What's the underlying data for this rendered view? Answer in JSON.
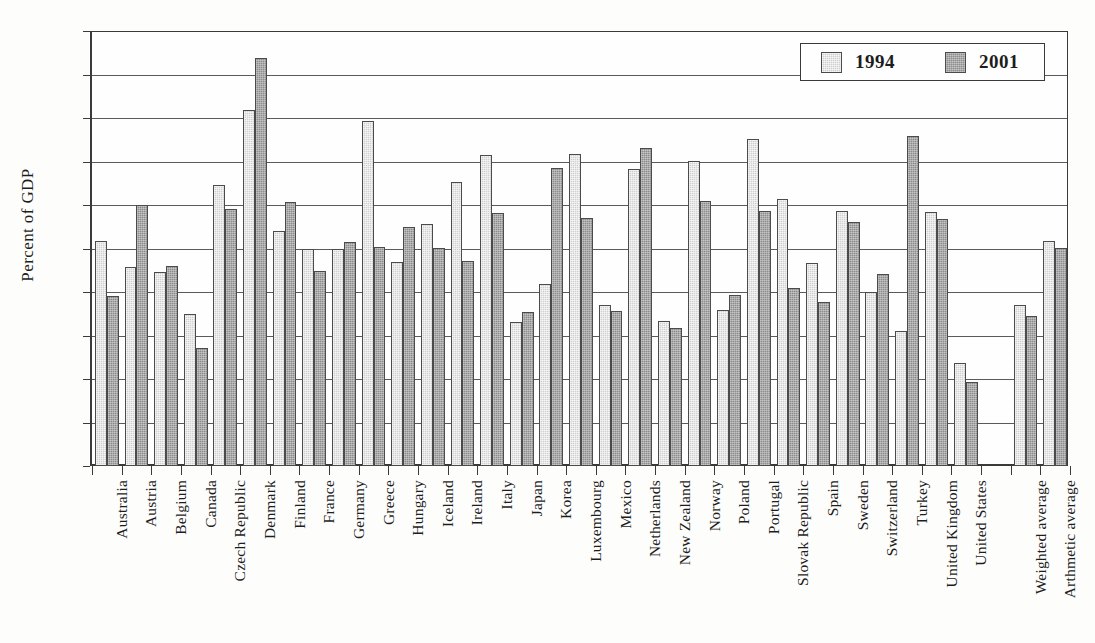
{
  "chart_data": {
    "type": "bar",
    "title": "",
    "xlabel": "",
    "ylabel": "Percent of  GDP",
    "ylim": [
      0.0,
      5.0
    ],
    "ytick_step": 0.5,
    "ytick_labels": [
      "0.0",
      "0.5",
      "1.0",
      "1.5",
      "2.0",
      "2.5",
      "3.0",
      "3.5",
      "4.0",
      "4.5",
      "5.0"
    ],
    "grid": true,
    "legend_position": "top-right",
    "categories": [
      "Australia",
      "Austria",
      "Belgium",
      "Canada",
      "Czech Republic",
      "Denmark",
      "Finland",
      "France",
      "Germany",
      "Greece",
      "Hungary",
      "Iceland",
      "Ireland",
      "Italy",
      "Japan",
      "Korea",
      "Luxembourg",
      "Mexico",
      "Netherlands",
      "New Zealand",
      "Norway",
      "Poland",
      "Portugal",
      "Slovak Republic",
      "Spain",
      "Sweden",
      "Switzerland",
      "Turkey",
      "United Kingdom",
      "United States",
      "",
      "Weighted average",
      "Arthmetic average"
    ],
    "series": [
      {
        "name": "1994",
        "color": "#d0d0d0",
        "values": [
          2.59,
          2.29,
          2.23,
          1.75,
          3.23,
          4.09,
          2.7,
          2.5,
          2.5,
          3.97,
          2.35,
          2.78,
          3.26,
          3.57,
          1.66,
          2.09,
          3.59,
          1.85,
          3.41,
          1.67,
          3.51,
          1.79,
          3.76,
          3.07,
          2.33,
          2.93,
          2.0,
          1.55,
          2.92,
          1.18,
          null,
          1.85,
          2.59
        ]
      },
      {
        "name": "2001",
        "color": "#8c8c8c",
        "values": [
          1.95,
          3.0,
          2.3,
          1.36,
          2.95,
          4.69,
          3.04,
          2.24,
          2.58,
          2.52,
          2.75,
          2.51,
          2.36,
          2.91,
          1.77,
          3.42,
          2.85,
          1.78,
          3.66,
          1.59,
          3.05,
          1.96,
          2.93,
          2.05,
          1.89,
          2.81,
          2.21,
          3.79,
          2.84,
          0.97,
          null,
          1.73,
          2.51
        ]
      }
    ]
  },
  "legend": {
    "items": [
      {
        "label": "1994",
        "swatch": "legend-swatch-1994"
      },
      {
        "label": "2001",
        "swatch": "legend-swatch-2001"
      }
    ]
  }
}
